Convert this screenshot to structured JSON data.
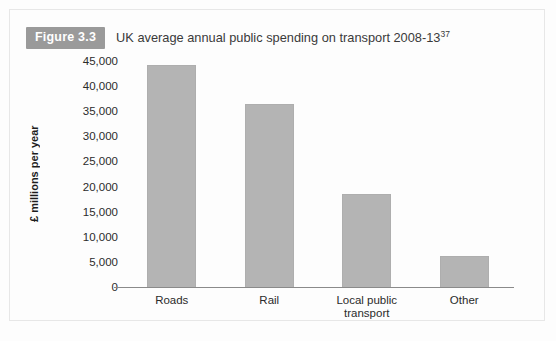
{
  "figure": {
    "badge": "Figure 3.3",
    "caption": "UK average annual public spending on transport 2008-13",
    "footnote_marker": "37"
  },
  "colors": {
    "bar_fill": "#b4b4b4",
    "badge_bg": "#9a9a9a",
    "axis": "#8a8a8a",
    "text": "#2b2b2b",
    "frame": "#e7e7e7"
  },
  "chart_data": {
    "type": "bar",
    "title": "UK average annual public spending on transport 2008-13",
    "xlabel": "",
    "ylabel": "£ millions per year",
    "categories": [
      "Roads",
      "Rail",
      "Local public transport",
      "Other"
    ],
    "category_lines": [
      [
        "Roads"
      ],
      [
        "Rail"
      ],
      [
        "Local public",
        "transport"
      ],
      [
        "Other"
      ]
    ],
    "values": [
      44500,
      36700,
      18800,
      6400
    ],
    "ylim": [
      0,
      45000
    ],
    "ytick_step": 5000,
    "yticks": [
      0,
      5000,
      10000,
      15000,
      20000,
      25000,
      30000,
      35000,
      40000,
      45000
    ],
    "ytick_labels": [
      "0",
      "5,000",
      "10,000",
      "15,000",
      "20,000",
      "25,000",
      "30,000",
      "35,000",
      "40,000",
      "45,000"
    ],
    "grid": false,
    "legend": false
  }
}
